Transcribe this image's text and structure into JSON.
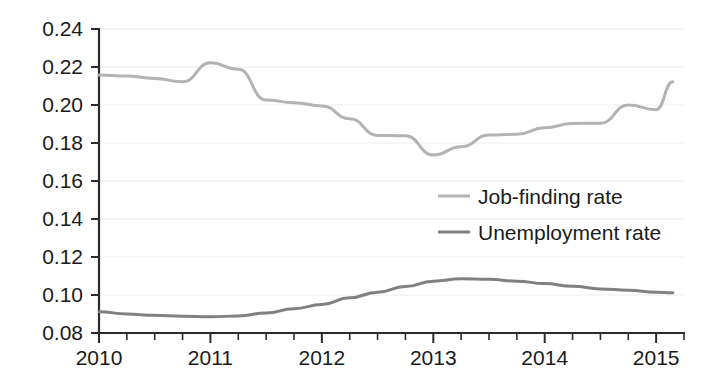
{
  "chart_data": {
    "type": "line",
    "title": "",
    "subtitle": "",
    "xlabel": "",
    "ylabel": "",
    "xlim": [
      2010.0,
      2015.25
    ],
    "ylim": [
      0.08,
      0.24
    ],
    "grid": true,
    "legend_position": "center-right",
    "x_tick_labels": [
      "2010",
      "2011",
      "2012",
      "2013",
      "2014",
      "2015"
    ],
    "x_tick_values": [
      2010,
      2011,
      2012,
      2013,
      2014,
      2015
    ],
    "x_minor_tick_step": 0.25,
    "y_tick_labels": [
      "0.08",
      "0.10",
      "0.12",
      "0.14",
      "0.16",
      "0.18",
      "0.20",
      "0.22",
      "0.24"
    ],
    "y_tick_values": [
      0.08,
      0.1,
      0.12,
      0.14,
      0.16,
      0.18,
      0.2,
      0.22,
      0.24
    ],
    "x": [
      2010.0,
      2010.25,
      2010.5,
      2010.75,
      2011.0,
      2011.25,
      2011.5,
      2011.75,
      2012.0,
      2012.25,
      2012.5,
      2012.75,
      2013.0,
      2013.25,
      2013.5,
      2013.75,
      2014.0,
      2014.25,
      2014.5,
      2014.75,
      2015.0,
      2015.15
    ],
    "series": [
      {
        "name": "Job-finding rate",
        "color": "#b3b3b3",
        "values": [
          0.2158,
          0.2152,
          0.214,
          0.2122,
          0.2222,
          0.2188,
          0.2026,
          0.2012,
          0.1995,
          0.1928,
          0.184,
          0.1838,
          0.1737,
          0.178,
          0.1842,
          0.1846,
          0.188,
          0.1903,
          0.1904,
          0.2,
          0.1975,
          0.2122
        ]
      },
      {
        "name": "Unemployment rate",
        "color": "#808080",
        "values": [
          0.0912,
          0.09,
          0.0893,
          0.0888,
          0.0885,
          0.089,
          0.0905,
          0.0928,
          0.095,
          0.0985,
          0.1015,
          0.1045,
          0.1073,
          0.1085,
          0.1083,
          0.1073,
          0.106,
          0.1046,
          0.1032,
          0.1025,
          0.1014,
          0.1012
        ]
      }
    ],
    "legend": [
      {
        "label": "Job-finding rate",
        "color": "#b3b3b3"
      },
      {
        "label": "Unemployment rate",
        "color": "#808080"
      }
    ]
  }
}
